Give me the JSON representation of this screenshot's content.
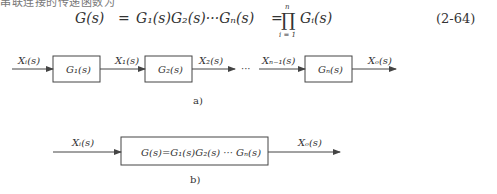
{
  "top_cutoff_text": "串联连接的传递函数为",
  "equation": {
    "lhs": "G(s)",
    "eq1": "=",
    "product_chain": "G₁(s)G₂(s)···Gₙ(s)",
    "eq2": "=",
    "prod_symbol": "∏",
    "prod_upper": "n",
    "prod_lower": "i = 1",
    "prod_term": "Gᵢ(s)",
    "number": "(2-64)"
  },
  "diagram_a": {
    "caption": "a)",
    "input_label": "Xᵢ(s)",
    "blocks": [
      {
        "label": "G₁(s)"
      },
      {
        "label": "G₂(s)"
      },
      {
        "label": "Gₙ(s)"
      }
    ],
    "signals": [
      "X₁(s)",
      "X₂(s)",
      "Xₙ₋₁(s)"
    ],
    "ellipsis": "···",
    "output_label": "Xₒ(s)"
  },
  "diagram_b": {
    "caption": "b)",
    "input_label": "Xᵢ(s)",
    "block_label": "G(s)=G₁(s)G₂(s) ··· Gₙ(s)",
    "output_label": "Xₒ(s)"
  },
  "colors": {
    "line": "#444444",
    "text": "#333333"
  }
}
